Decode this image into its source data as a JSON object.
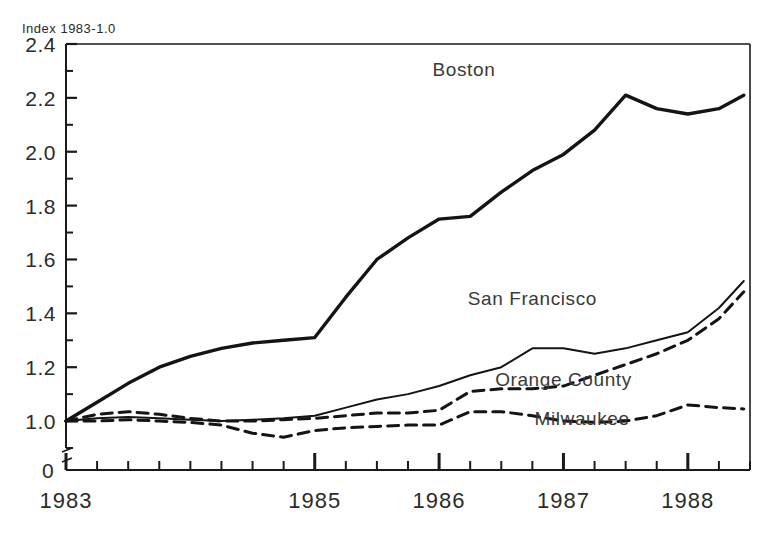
{
  "chart_data": {
    "type": "line",
    "title": "",
    "ylabel": "Index 1983-1.0",
    "xlabel": "",
    "ylim": [
      0.9,
      2.4
    ],
    "xlim": [
      1983.0,
      1988.5
    ],
    "grid": false,
    "legend_position": "inline-annotations",
    "y_ticks": [
      "1.0",
      "1.2",
      "1.4",
      "1.6",
      "1.8",
      "2.0",
      "2.2",
      "2.4"
    ],
    "y_tick_values": [
      1.0,
      1.2,
      1.4,
      1.6,
      1.8,
      2.0,
      2.2,
      2.4
    ],
    "y_minor_step": 0.1,
    "y_axis_break_label": "0",
    "x_ticks": [
      "1983",
      "1985",
      "1986",
      "1987",
      "1988"
    ],
    "x_tick_values": [
      1983,
      1985,
      1986,
      1987,
      1988
    ],
    "x_minor_step": 0.25,
    "x": [
      1983.0,
      1983.25,
      1983.5,
      1983.75,
      1984.0,
      1984.25,
      1984.5,
      1984.75,
      1985.0,
      1985.25,
      1985.5,
      1985.75,
      1986.0,
      1986.25,
      1986.5,
      1986.75,
      1987.0,
      1987.25,
      1987.5,
      1987.75,
      1988.0,
      1988.25,
      1988.45
    ],
    "series": [
      {
        "name": "Boston",
        "style": "solid-thick",
        "label_x": 1986.2,
        "label_y": 2.28,
        "values": [
          1.0,
          1.07,
          1.14,
          1.2,
          1.24,
          1.27,
          1.29,
          1.3,
          1.31,
          1.46,
          1.6,
          1.68,
          1.75,
          1.76,
          1.85,
          1.93,
          1.99,
          2.08,
          2.21,
          2.16,
          2.14,
          2.16,
          2.21
        ]
      },
      {
        "name": "San Francisco",
        "style": "solid-thin",
        "label_x": 1986.75,
        "label_y": 1.43,
        "values": [
          1.0,
          1.01,
          1.015,
          1.01,
          1.005,
          1.0,
          1.005,
          1.01,
          1.02,
          1.05,
          1.08,
          1.1,
          1.13,
          1.17,
          1.2,
          1.27,
          1.27,
          1.25,
          1.27,
          1.3,
          1.33,
          1.42,
          1.52
        ]
      },
      {
        "name": "Orange County",
        "style": "dashed",
        "label_x": 1987.0,
        "label_y": 1.13,
        "values": [
          1.0,
          1.025,
          1.035,
          1.025,
          1.01,
          1.0,
          1.0,
          1.005,
          1.01,
          1.02,
          1.03,
          1.03,
          1.04,
          1.11,
          1.12,
          1.12,
          1.13,
          1.17,
          1.21,
          1.25,
          1.3,
          1.38,
          1.48
        ]
      },
      {
        "name": "Milwaukee",
        "style": "dashed",
        "label_x": 1987.15,
        "label_y": 0.985,
        "values": [
          1.0,
          1.0,
          1.005,
          1.0,
          0.995,
          0.985,
          0.955,
          0.94,
          0.965,
          0.975,
          0.98,
          0.985,
          0.985,
          1.035,
          1.035,
          1.02,
          1.0,
          0.995,
          1.0,
          1.02,
          1.06,
          1.05,
          1.045
        ]
      }
    ]
  }
}
